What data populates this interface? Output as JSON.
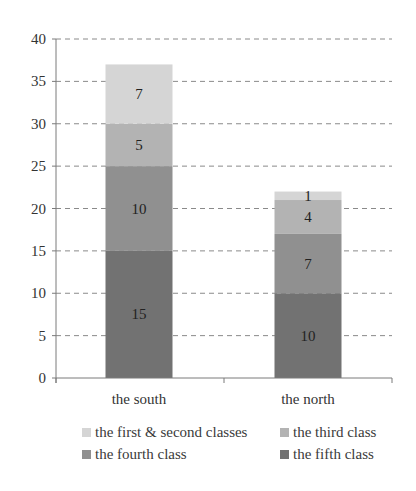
{
  "chart_data": {
    "type": "bar",
    "stacked": true,
    "title": "",
    "xlabel": "",
    "ylabel": "",
    "categories": [
      "the south",
      "the north"
    ],
    "series": [
      {
        "name": "the fifth class",
        "values": [
          15,
          10
        ],
        "color": "#727272"
      },
      {
        "name": "the fourth class",
        "values": [
          10,
          7
        ],
        "color": "#909090"
      },
      {
        "name": "the third class",
        "values": [
          5,
          4
        ],
        "color": "#b3b3b3"
      },
      {
        "name": "the first & second classes",
        "values": [
          7,
          1
        ],
        "color": "#d5d5d5"
      }
    ],
    "ylim": [
      0,
      40
    ],
    "yticks": [
      0,
      5,
      10,
      15,
      20,
      25,
      30,
      35,
      40
    ],
    "grid": true,
    "grid_style": "dashed",
    "data_labels": true,
    "legend_position": "bottom"
  },
  "legend": {
    "items": [
      {
        "label": "the first & second classes",
        "color": "#d5d5d5"
      },
      {
        "label": "the third class",
        "color": "#b3b3b3"
      },
      {
        "label": "the fourth class",
        "color": "#909090"
      },
      {
        "label": "the fifth class",
        "color": "#727272"
      }
    ]
  }
}
